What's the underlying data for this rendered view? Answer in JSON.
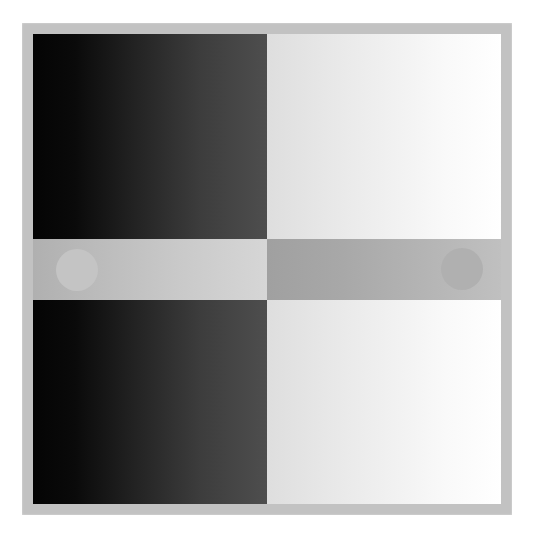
{
  "chart_data": {
    "type": "heatmap",
    "xlabel": "",
    "ylabel": "",
    "grid": false,
    "legend": "none",
    "canvas": {
      "width": 533,
      "height": 541,
      "background": "#ffffff"
    },
    "frame": {
      "name": "border-frame",
      "fill": "#c2c2c2",
      "x": 22,
      "y": 23,
      "width": 490,
      "height": 492,
      "thickness": 11
    },
    "regions": [
      {
        "name": "top-left-panel",
        "role": "dark horizontal gradient",
        "gradient_direction": "left-to-right",
        "value_start": "#040404",
        "value_end": "#4e4e4e",
        "luminance_start": 4,
        "luminance_end": 78,
        "x": 0,
        "y": 0,
        "width": 234,
        "height": 205
      },
      {
        "name": "top-right-panel",
        "role": "light horizontal gradient",
        "gradient_direction": "left-to-right",
        "value_start": "#dedede",
        "value_end": "#ffffff",
        "luminance_start": 222,
        "luminance_end": 255,
        "x": 234,
        "y": 0,
        "width": 235,
        "height": 205
      },
      {
        "name": "bottom-left-panel",
        "role": "dark horizontal gradient",
        "gradient_direction": "left-to-right",
        "value_start": "#040404",
        "value_end": "#4e4e4e",
        "luminance_start": 4,
        "luminance_end": 78,
        "x": 0,
        "y": 266,
        "width": 234,
        "height": 204
      },
      {
        "name": "bottom-right-panel",
        "role": "light horizontal gradient",
        "gradient_direction": "left-to-right",
        "value_start": "#dedede",
        "value_end": "#ffffff",
        "luminance_start": 222,
        "luminance_end": 255,
        "x": 234,
        "y": 266,
        "width": 235,
        "height": 204
      },
      {
        "name": "center-band-left",
        "role": "mid gray gradient band",
        "gradient_direction": "left-to-right",
        "value_start": "#b0b0b0",
        "value_end": "#d6d6d6",
        "luminance_start": 176,
        "luminance_end": 214,
        "x": 0,
        "y": 205,
        "width": 234,
        "height": 61
      },
      {
        "name": "center-band-right",
        "role": "mid gray gradient band",
        "gradient_direction": "left-to-right",
        "value_start": "#a0a0a0",
        "value_end": "#c0c0c0",
        "luminance_start": 160,
        "luminance_end": 192,
        "x": 234,
        "y": 205,
        "width": 235,
        "height": 61
      }
    ],
    "markers": [
      {
        "name": "left-circle-patch",
        "shape": "circle",
        "fill": "#c4c4c4",
        "luminance": 196,
        "center_x": 44,
        "center_y": 236,
        "diameter": 42,
        "contrast": "lighter than surrounding band"
      },
      {
        "name": "right-circle-patch",
        "shape": "circle",
        "fill": "#b0b0b0",
        "luminance": 176,
        "center_x": 429,
        "center_y": 235,
        "diameter": 42,
        "contrast": "darker than surrounding band"
      }
    ],
    "palette": {
      "background": "#ffffff",
      "frame": "#c2c2c2",
      "black_end": "#040404",
      "dark_end": "#4e4e4e",
      "light_start": "#dedede",
      "white_end": "#ffffff",
      "band_light": "#c4c4c4",
      "band_dark": "#a8a8a8"
    }
  }
}
